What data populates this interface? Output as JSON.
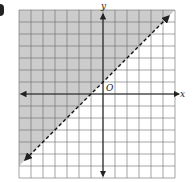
{
  "chart_data": {
    "type": "line",
    "title": "",
    "xlabel": "x",
    "ylabel": "y",
    "origin_label": "O",
    "xlim": [
      -7,
      6
    ],
    "ylim": [
      -7,
      7
    ],
    "grid": true,
    "grid_step": 1,
    "boundary_line": {
      "equation": "y = x + 1",
      "slope": 1,
      "intercept": 1,
      "style": "dashed",
      "arrows": "both"
    },
    "shaded_region": {
      "side": "above",
      "inequality": "y > x + 1",
      "color": "#cccccc"
    }
  },
  "colors": {
    "shade": "#cccccc",
    "grid": "#6a6a6a",
    "axis": "#222222",
    "background": "#ffffff"
  }
}
